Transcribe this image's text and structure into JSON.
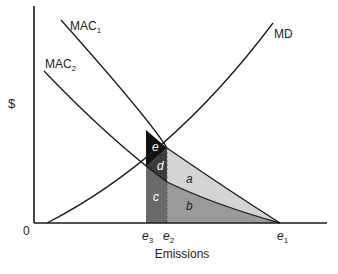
{
  "diagram": {
    "y_axis_label": "$",
    "x_axis_label": "Emissions",
    "origin_label": "0",
    "curves": [
      {
        "name": "MAC",
        "sub": "1"
      },
      {
        "name": "MAC",
        "sub": "2"
      },
      {
        "name": "MD",
        "sub": ""
      }
    ],
    "ticks": [
      {
        "name": "e",
        "sub": "3"
      },
      {
        "name": "e",
        "sub": "2"
      },
      {
        "name": "e",
        "sub": "1"
      }
    ],
    "regions": [
      "a",
      "b",
      "c",
      "d",
      "e"
    ],
    "colors": {
      "region_a": "#d4d4d4",
      "region_b": "#9a9a9a",
      "region_c": "#6a6a6a",
      "region_d": "#3c3c3c",
      "region_e": "#111111",
      "line": "#1a1a1a"
    }
  }
}
